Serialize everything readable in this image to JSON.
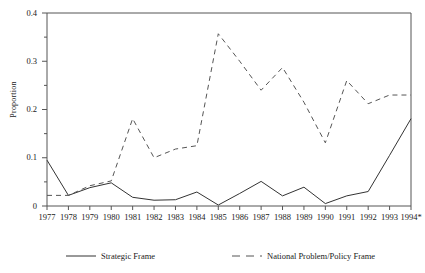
{
  "chart_data": {
    "type": "line",
    "title": "",
    "xlabel": "",
    "ylabel": "Proportion",
    "ylim": [
      0,
      0.4
    ],
    "y_major_ticks": [
      0,
      0.1,
      0.2,
      0.3,
      0.4
    ],
    "y_major_tick_labels": [
      "0",
      "0.1",
      "0.2",
      "0.3",
      "0.4"
    ],
    "y_minor_ticks": [
      0.05,
      0.15,
      0.25,
      0.35
    ],
    "grid": false,
    "legend_position": "below-axes",
    "categories": [
      "1977",
      "1978",
      "1979",
      "1980",
      "1981",
      "1982",
      "1983",
      "1984",
      "1985",
      "1986",
      "1987",
      "1988",
      "1989",
      "1990",
      "1991",
      "1992",
      "1993",
      "1994*"
    ],
    "series": [
      {
        "name": "Strategic Frame",
        "style": "solid",
        "color": "#333333",
        "values": [
          0.095,
          0.022,
          0.038,
          0.048,
          0.018,
          0.012,
          0.013,
          0.029,
          0.002,
          0.026,
          0.051,
          0.021,
          0.039,
          0.005,
          0.021,
          0.03,
          0.105,
          0.181
        ]
      },
      {
        "name": "National Problem/Policy Frame",
        "style": "dashed",
        "color": "#555555",
        "values": [
          0.022,
          0.022,
          0.042,
          0.052,
          0.181,
          0.1,
          0.118,
          0.125,
          0.357,
          0.3,
          0.24,
          0.287,
          0.215,
          0.131,
          0.26,
          0.212,
          0.23,
          0.23
        ]
      }
    ]
  },
  "legend": {
    "entries": [
      {
        "label": "Strategic Frame",
        "style": "solid"
      },
      {
        "label": "National Problem/Policy Frame",
        "style": "dashed"
      }
    ]
  }
}
